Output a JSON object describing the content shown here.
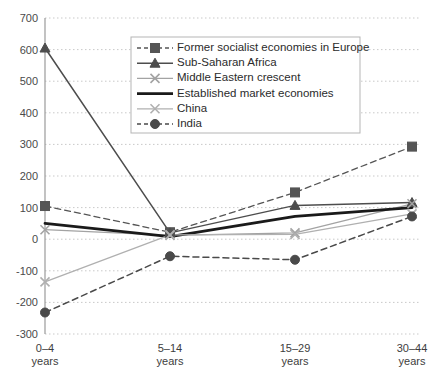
{
  "chart_data": {
    "type": "line",
    "title": "",
    "subtitle": "",
    "xlabel": "",
    "ylabel": "",
    "categories": [
      "0–4 years",
      "5–14 years",
      "15–29 years",
      "30–44 years"
    ],
    "category_lines": [
      [
        "0–4",
        "years"
      ],
      [
        "5–14",
        "years"
      ],
      [
        "15–29",
        "years"
      ],
      [
        "30–44",
        "years"
      ]
    ],
    "ylim": [
      -300,
      700
    ],
    "yticks": [
      700,
      600,
      500,
      400,
      300,
      200,
      100,
      0,
      -100,
      -200,
      -300
    ],
    "ytick_labels": [
      "700",
      "600",
      "500",
      "400",
      "300",
      "200",
      "100",
      "0",
      "-100",
      "-200",
      "-300"
    ],
    "grid": true,
    "grid_axis": "y",
    "legend_position": "top-center-inside",
    "series": [
      {
        "name": "Former socialist economies in Europe",
        "values": [
          105,
          22,
          148,
          293
        ],
        "color": "#555555",
        "marker": "square",
        "dash": "dashed",
        "width": 1.3
      },
      {
        "name": "Sub-Saharan Africa",
        "values": [
          605,
          20,
          107,
          116
        ],
        "color": "#4d4d4d",
        "marker": "triangle",
        "dash": "solid",
        "width": 1.5
      },
      {
        "name": "Middle Eastern crescent",
        "values": [
          30,
          12,
          20,
          112
        ],
        "color": "#a3a3a3",
        "marker": "x",
        "dash": "solid",
        "width": 1.3
      },
      {
        "name": "Established market economies",
        "values": [
          50,
          8,
          72,
          100
        ],
        "color": "#1a1a1a",
        "marker": "none",
        "dash": "solid",
        "width": 2.8
      },
      {
        "name": "China",
        "values": [
          -135,
          14,
          15,
          80
        ],
        "color": "#b0b0b0",
        "marker": "x",
        "dash": "solid",
        "width": 1.3
      },
      {
        "name": "India",
        "values": [
          -232,
          -54,
          -65,
          72
        ],
        "color": "#4a4a4a",
        "marker": "circle",
        "dash": "dashed",
        "width": 1.5
      }
    ]
  },
  "legend": {
    "entries": [
      "Former socialist economies in Europe",
      "Sub-Saharan Africa",
      "Middle Eastern crescent",
      "Established market economies",
      "China",
      "India"
    ]
  },
  "colors": {
    "background": "#ffffff",
    "grid": "#c9c9c9",
    "axis": "#9a9a9a",
    "legend_border": "#b5b5b5",
    "text": "#3d3d3d"
  }
}
